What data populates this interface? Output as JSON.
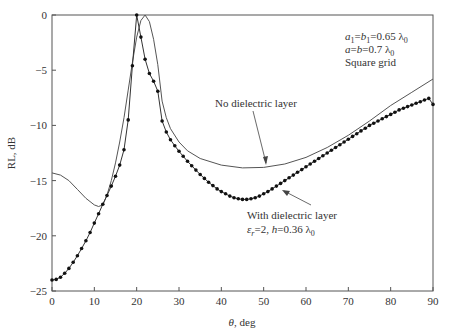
{
  "chart_data": {
    "type": "line",
    "title": "",
    "xlabel": "θ, deg",
    "ylabel": "RL, dB",
    "xlim": [
      0,
      90
    ],
    "ylim": [
      -25,
      0
    ],
    "xticks": [
      0,
      10,
      20,
      30,
      40,
      50,
      60,
      70,
      80,
      90
    ],
    "yticks": [
      0,
      -5,
      -10,
      -15,
      -20,
      -25
    ],
    "xtick_labels": [
      "0",
      "10",
      "20",
      "30",
      "40",
      "50",
      "60",
      "70",
      "80",
      "90"
    ],
    "ytick_labels": [
      "0",
      "−5",
      "−10",
      "−15",
      "−20",
      "−25"
    ],
    "grid": false,
    "series": [
      {
        "name": "No dielectric layer",
        "style": "line",
        "x": [
          0,
          2,
          4,
          6,
          8,
          10,
          11,
          12,
          13,
          14,
          15,
          16,
          17,
          18,
          19,
          20,
          21,
          22,
          23,
          24,
          25,
          26,
          27,
          28,
          30,
          32,
          35,
          40,
          45,
          50,
          55,
          60,
          65,
          70,
          75,
          80,
          85,
          90
        ],
        "values": [
          -14.3,
          -14.5,
          -15.0,
          -15.8,
          -16.6,
          -17.2,
          -17.35,
          -17.2,
          -16.3,
          -15.0,
          -13.4,
          -11.5,
          -9.3,
          -6.8,
          -4.3,
          -2.0,
          -0.5,
          0,
          -0.6,
          -2.2,
          -4.5,
          -7.8,
          -9.3,
          -10.3,
          -11.5,
          -12.3,
          -13.0,
          -13.6,
          -13.85,
          -13.8,
          -13.5,
          -12.9,
          -12.0,
          -10.9,
          -9.6,
          -8.2,
          -7.0,
          -5.8
        ]
      },
      {
        "name": "With dielectric layer",
        "style": "line+markers",
        "x": [
          0,
          1,
          2,
          3,
          4,
          5,
          6,
          7,
          8,
          9,
          10,
          11,
          12,
          13,
          14,
          15,
          16,
          17,
          18,
          19,
          20,
          21,
          22,
          23,
          24,
          25,
          26,
          27,
          28,
          29,
          30,
          31,
          32,
          33,
          34,
          35,
          36,
          37,
          38,
          39,
          40,
          41,
          42,
          43,
          44,
          45,
          46,
          47,
          48,
          49,
          50,
          51,
          52,
          53,
          54,
          55,
          56,
          57,
          58,
          59,
          60,
          61,
          62,
          63,
          64,
          65,
          66,
          67,
          68,
          69,
          70,
          71,
          72,
          73,
          74,
          75,
          76,
          77,
          78,
          79,
          80,
          81,
          82,
          83,
          84,
          85,
          86,
          87,
          88,
          89,
          90
        ],
        "values": [
          -24.0,
          -23.95,
          -23.75,
          -23.4,
          -22.95,
          -22.4,
          -21.8,
          -21.15,
          -20.45,
          -19.7,
          -18.85,
          -18.0,
          -17.15,
          -16.35,
          -15.5,
          -14.6,
          -13.6,
          -12.2,
          -9.5,
          -4.6,
          0,
          -2.0,
          -4.0,
          -5.3,
          -6.0,
          -6.9,
          -9.6,
          -10.6,
          -11.3,
          -11.85,
          -12.35,
          -12.8,
          -13.25,
          -13.65,
          -14.05,
          -14.45,
          -14.8,
          -15.15,
          -15.45,
          -15.75,
          -16.0,
          -16.2,
          -16.4,
          -16.55,
          -16.65,
          -16.7,
          -16.7,
          -16.65,
          -16.55,
          -16.4,
          -16.2,
          -16.0,
          -15.75,
          -15.5,
          -15.25,
          -15.0,
          -14.75,
          -14.5,
          -14.25,
          -14.0,
          -13.75,
          -13.5,
          -13.25,
          -13.0,
          -12.75,
          -12.5,
          -12.25,
          -12.0,
          -11.75,
          -11.5,
          -11.25,
          -11.0,
          -10.75,
          -10.5,
          -10.25,
          -10.0,
          -9.8,
          -9.6,
          -9.4,
          -9.2,
          -9.0,
          -8.8,
          -8.6,
          -8.45,
          -8.3,
          -8.15,
          -8.0,
          -7.85,
          -7.7,
          -7.55,
          -8.1
        ]
      }
    ],
    "annotations": [
      {
        "text": "No dielectric layer",
        "points_to": "No dielectric layer curve near θ≈47°"
      },
      {
        "text_line1": "With dielectric layer",
        "text_line2": "εr = 2, h = 0.36 λ0",
        "points_to": "With dielectric layer curve near θ≈49°"
      },
      {
        "text_line1": "a1 = b1 = 0.65 λ0",
        "text_line2": "a = b = 0.7 λ0",
        "text_line3": "Square grid",
        "position": "top-right"
      }
    ]
  },
  "labels": {
    "no_dielectric": "No dielectric layer",
    "with_dielectric": "With dielectric layer",
    "dielectric_params_eps": "ε",
    "dielectric_params_r": "r",
    "dielectric_params_rest": "=2, ",
    "dielectric_params_h": "h",
    "dielectric_params_tail": "=0.36 λ",
    "dielectric_params_sub0": "0",
    "param1_a": "a",
    "param1_s1": "1",
    "param1_eq1": "=",
    "param1_b": "b",
    "param1_s2": "1",
    "param1_tail": "=0.65 λ",
    "param1_sub0": "0",
    "param2_a": "a",
    "param2_eq": "=",
    "param2_b": "b",
    "param2_tail": "=0.7 λ",
    "param2_sub0": "0",
    "param3": "Square grid",
    "xlabel_theta": "θ",
    "xlabel_rest": ", deg",
    "ylabel": "RL, dB"
  }
}
